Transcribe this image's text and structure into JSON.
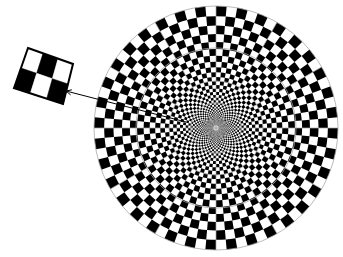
{
  "figure": {
    "description": "Radial (log-polar) black and white checkerboard disc with a magnified inset of a patch of checks, connected by a pointer line",
    "background": "#ffffff",
    "disc": {
      "center": [
        216,
        128
      ],
      "outer_radius": 122,
      "inner_radius": 2.5,
      "angular_divisions": 72,
      "ring_growth_factor": 1.091,
      "check_colors": [
        "#000000",
        "#ffffff"
      ],
      "guide_color": "#a8a8a8",
      "guide_ring_radii": [
        122,
        80,
        47,
        25
      ],
      "guide_spoke_count": 12
    },
    "inset": {
      "corners": [
        [
          28,
          48
        ],
        [
          73,
          64
        ],
        [
          63,
          104
        ],
        [
          14,
          88
        ]
      ],
      "columns": 3,
      "rows": 2,
      "pattern": [
        [
          "white",
          "black",
          "white"
        ],
        [
          "black",
          "white",
          "black"
        ]
      ],
      "border_color": "#000000"
    },
    "pointer": {
      "from": [
        186,
        122
      ],
      "to": [
        66,
        91
      ],
      "color": "#000000"
    }
  }
}
